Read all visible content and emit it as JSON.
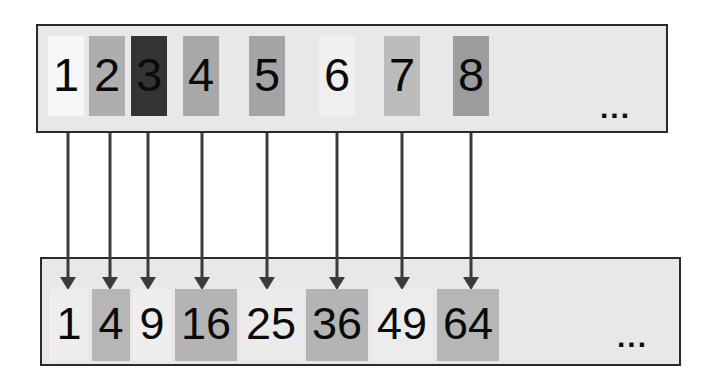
{
  "figure": {
    "title_visible": false,
    "background_color": "#ffffff",
    "box_fill_color": "#e8e8e8",
    "box_border_color": "#2a2a2a",
    "arrow_color": "#3b3b3b",
    "text_color": "#0a0a0a"
  },
  "top_row": {
    "name": "inputs",
    "ellipsis": "...",
    "tiles": [
      {
        "label": "1",
        "value": 1,
        "fill": "#f7f7f7",
        "x": 48,
        "y": 36,
        "w": 36,
        "h": 80
      },
      {
        "label": "2",
        "value": 2,
        "fill": "#aeaeae",
        "x": 89,
        "y": 36,
        "w": 36,
        "h": 80
      },
      {
        "label": "3",
        "value": 3,
        "fill": "#343434",
        "x": 131,
        "y": 36,
        "w": 36,
        "h": 80
      },
      {
        "label": "4",
        "value": 4,
        "fill": "#a8a8a8",
        "x": 183,
        "y": 36,
        "w": 36,
        "h": 80
      },
      {
        "label": "5",
        "value": 5,
        "fill": "#a4a4a4",
        "x": 249,
        "y": 36,
        "w": 36,
        "h": 80
      },
      {
        "label": "6",
        "value": 6,
        "fill": "#efefef",
        "x": 319,
        "y": 36,
        "w": 36,
        "h": 80
      },
      {
        "label": "7",
        "value": 7,
        "fill": "#bcbcbc",
        "x": 384,
        "y": 36,
        "w": 36,
        "h": 80
      },
      {
        "label": "8",
        "value": 8,
        "fill": "#9c9c9c",
        "x": 453,
        "y": 36,
        "w": 36,
        "h": 80
      }
    ]
  },
  "bottom_row": {
    "name": "outputs",
    "ellipsis": "...",
    "tiles": [
      {
        "label": "1",
        "value": 1,
        "fill": "#ededed",
        "x": 50,
        "y": 289,
        "w": 38,
        "h": 72
      },
      {
        "label": "4",
        "value": 4,
        "fill": "#b6b6b6",
        "x": 92,
        "y": 289,
        "w": 38,
        "h": 72
      },
      {
        "label": "9",
        "value": 9,
        "fill": "#eeeeee",
        "x": 133,
        "y": 289,
        "w": 38,
        "h": 72
      },
      {
        "label": "16",
        "value": 16,
        "fill": "#b4b4b4",
        "x": 175,
        "y": 289,
        "w": 62,
        "h": 72
      },
      {
        "label": "25",
        "value": 25,
        "fill": "#ebebeb",
        "x": 240,
        "y": 289,
        "w": 62,
        "h": 72
      },
      {
        "label": "36",
        "value": 36,
        "fill": "#b4b4b4",
        "x": 306,
        "y": 289,
        "w": 62,
        "h": 72
      },
      {
        "label": "49",
        "value": 49,
        "fill": "#ececec",
        "x": 371,
        "y": 289,
        "w": 62,
        "h": 72
      },
      {
        "label": "64",
        "value": 64,
        "fill": "#b6b6b6",
        "x": 437,
        "y": 289,
        "w": 62,
        "h": 72
      }
    ]
  },
  "arrows": [
    {
      "name": "arrow-1",
      "from_label": "1",
      "to_label": "1",
      "x": 68,
      "y1": 133,
      "y2": 290
    },
    {
      "name": "arrow-2",
      "from_label": "2",
      "to_label": "4",
      "x": 110,
      "y1": 133,
      "y2": 290
    },
    {
      "name": "arrow-3",
      "from_label": "3",
      "to_label": "9",
      "x": 148,
      "y1": 133,
      "y2": 290
    },
    {
      "name": "arrow-4",
      "from_label": "4",
      "to_label": "16",
      "x": 202,
      "y1": 133,
      "y2": 290
    },
    {
      "name": "arrow-5",
      "from_label": "5",
      "to_label": "25",
      "x": 267,
      "y1": 133,
      "y2": 290
    },
    {
      "name": "arrow-6",
      "from_label": "6",
      "to_label": "36",
      "x": 337,
      "y1": 133,
      "y2": 290
    },
    {
      "name": "arrow-7",
      "from_label": "7",
      "to_label": "49",
      "x": 402,
      "y1": 133,
      "y2": 290
    },
    {
      "name": "arrow-8",
      "from_label": "8",
      "to_label": "64",
      "x": 471,
      "y1": 133,
      "y2": 290
    }
  ],
  "chart_data": {
    "type": "diagram",
    "title": "",
    "mapping_name": "square function",
    "inputs": [
      1,
      2,
      3,
      4,
      5,
      6,
      7,
      8
    ],
    "outputs": [
      1,
      4,
      9,
      16,
      25,
      36,
      49,
      64
    ],
    "input_labels": [
      "1",
      "2",
      "3",
      "4",
      "5",
      "6",
      "7",
      "8"
    ],
    "output_labels": [
      "1",
      "4",
      "9",
      "16",
      "25",
      "36",
      "49",
      "64"
    ],
    "continuation_marker": "...",
    "pairs": [
      [
        1,
        1
      ],
      [
        2,
        4
      ],
      [
        3,
        9
      ],
      [
        4,
        16
      ],
      [
        5,
        25
      ],
      [
        6,
        36
      ],
      [
        7,
        49
      ],
      [
        8,
        64
      ]
    ]
  }
}
